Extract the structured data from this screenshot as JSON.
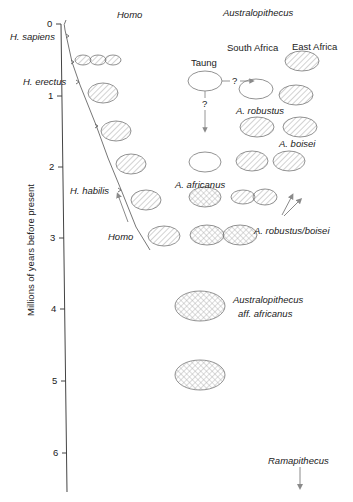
{
  "diagram": {
    "column_headers": {
      "homo": "Homo",
      "australopithecus": "Australopithecus"
    },
    "region_headers": {
      "south_africa": "South Africa",
      "east_africa": "East Africa"
    },
    "y_axis": {
      "label": "Millions of years before present",
      "ticks": [
        "0",
        "1",
        "2",
        "3",
        "4",
        "5",
        "6"
      ]
    },
    "homo_labels": {
      "sapiens": "H. sapiens",
      "erectus": "H. erectus",
      "habilis": "H. habilis",
      "homo_origin": "Homo"
    },
    "australopithecus_labels": {
      "taung": "Taung",
      "question_1": "?",
      "question_2": "?",
      "robustus": "A. robustus",
      "boisei": "A. boisei",
      "africanus": "A. africanus",
      "robustus_boisei": "A. robustus/boisei",
      "aff_africanus_1": "Australopithecus",
      "aff_africanus_2": "aff. africanus",
      "ramapithecus": "Ramapithecus"
    },
    "colors": {
      "line": "#555555",
      "ellipse_stroke": "#777777",
      "hatch": "#9a9a9a",
      "arrow": "#8a8a8a"
    }
  }
}
